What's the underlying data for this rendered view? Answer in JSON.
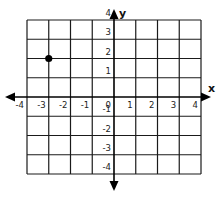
{
  "chart_data": {
    "type": "scatter",
    "title": "",
    "xlabel": "x",
    "ylabel": "y",
    "xlim": [
      -4,
      4
    ],
    "ylim": [
      -4,
      4
    ],
    "grid": true,
    "x_ticks": [
      "-4",
      "-3",
      "-2",
      "-1",
      "0",
      "1",
      "2",
      "3",
      "4"
    ],
    "y_ticks": [
      "-4",
      "-3",
      "-2",
      "-1",
      "1",
      "2",
      "3",
      "4"
    ],
    "points": [
      {
        "x": -3,
        "y": 2
      }
    ],
    "colors": {
      "grid": "#1a1a1a",
      "point": "#000000"
    }
  }
}
